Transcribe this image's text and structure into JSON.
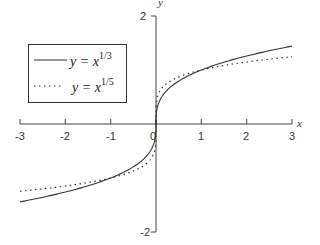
{
  "chart_data": {
    "type": "line",
    "title": "",
    "xlabel": "x",
    "ylabel": "y",
    "xlim": [
      -3,
      3
    ],
    "ylim": [
      -2,
      2
    ],
    "x_ticks": [
      "-3",
      "-2",
      "-1",
      "0",
      "1",
      "2",
      "3"
    ],
    "y_ticks": [
      "2",
      "-2"
    ],
    "grid": false,
    "legend_position": "upper-left",
    "series": [
      {
        "name": "y = x^(1/3)",
        "label_base": "y = x",
        "label_exp": "1/3",
        "style": "solid",
        "color": "#333333",
        "x": [
          -3,
          -2.5,
          -2,
          -1.5,
          -1,
          -0.5,
          -0.2,
          -0.05,
          -0.01,
          0,
          0.01,
          0.05,
          0.2,
          0.5,
          1,
          1.5,
          2,
          2.5,
          3
        ],
        "values": [
          -1.442,
          -1.357,
          -1.26,
          -1.145,
          -1.0,
          -0.794,
          -0.585,
          -0.368,
          -0.215,
          0,
          0.215,
          0.368,
          0.585,
          0.794,
          1.0,
          1.145,
          1.26,
          1.357,
          1.442
        ]
      },
      {
        "name": "y = x^(1/5)",
        "label_base": "y = x",
        "label_exp": "1/5",
        "style": "dotted",
        "color": "#333333",
        "x": [
          -3,
          -2.5,
          -2,
          -1.5,
          -1,
          -0.5,
          -0.2,
          -0.05,
          -0.01,
          0,
          0.01,
          0.05,
          0.2,
          0.5,
          1,
          1.5,
          2,
          2.5,
          3
        ],
        "values": [
          -1.246,
          -1.201,
          -1.149,
          -1.084,
          -1.0,
          -0.871,
          -0.725,
          -0.549,
          -0.398,
          0,
          0.398,
          0.549,
          0.725,
          0.871,
          1.0,
          1.084,
          1.149,
          1.201,
          1.246
        ]
      }
    ]
  },
  "axis": {
    "x_name": "x",
    "y_name": "y",
    "x_tick_labels": [
      "-3",
      "-2",
      "-1",
      "0",
      "1",
      "2",
      "3"
    ],
    "y_top_label": "2",
    "y_bottom_label": "-2"
  },
  "legend": {
    "items": [
      {
        "base": "y = x",
        "exp": "1/3",
        "style": "solid"
      },
      {
        "base": "y = x",
        "exp": "1/5",
        "style": "dotted"
      }
    ]
  }
}
